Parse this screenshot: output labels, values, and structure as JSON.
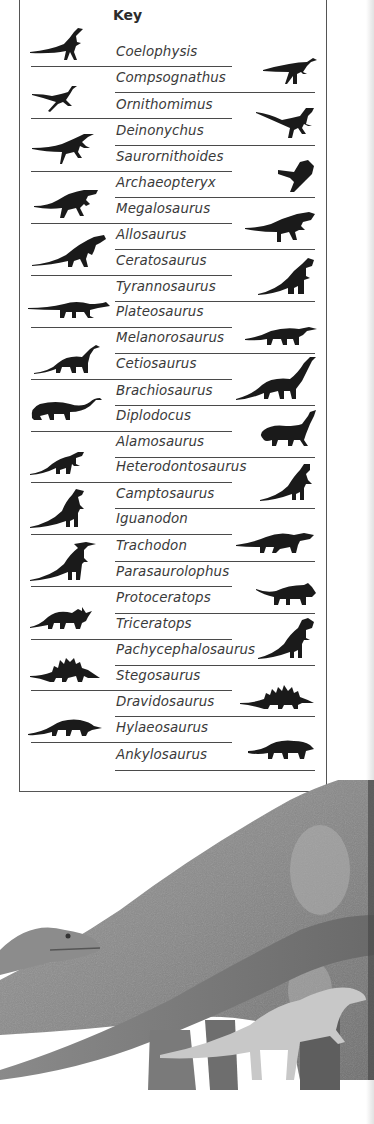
{
  "key": {
    "title": "Key",
    "entries": [
      {
        "name": "Coelophysis"
      },
      {
        "name": "Compsognathus"
      },
      {
        "name": "Ornithomimus"
      },
      {
        "name": "Deinonychus"
      },
      {
        "name": "Saurornithoides"
      },
      {
        "name": "Archaeopteryx"
      },
      {
        "name": "Megalosaurus"
      },
      {
        "name": "Allosaurus"
      },
      {
        "name": "Ceratosaurus"
      },
      {
        "name": "Tyrannosaurus"
      },
      {
        "name": "Plateosaurus"
      },
      {
        "name": "Melanorosaurus"
      },
      {
        "name": "Cetiosaurus"
      },
      {
        "name": "Brachiosaurus"
      },
      {
        "name": "Diplodocus"
      },
      {
        "name": "Alamosaurus"
      },
      {
        "name": "Heterodontosaurus"
      },
      {
        "name": "Camptosaurus"
      },
      {
        "name": "Iguanodon"
      },
      {
        "name": "Trachodon"
      },
      {
        "name": "Parasaurolophus"
      },
      {
        "name": "Protoceratops"
      },
      {
        "name": "Triceratops"
      },
      {
        "name": "Pachycephalosaurus"
      },
      {
        "name": "Stegosaurus"
      },
      {
        "name": "Dravidosaurus"
      },
      {
        "name": "Hylaeosaurus"
      },
      {
        "name": "Ankylosaurus"
      }
    ]
  },
  "illustration": {
    "description": "Pencil illustration of large sauropods with a small theropod head and an ornithopod"
  }
}
